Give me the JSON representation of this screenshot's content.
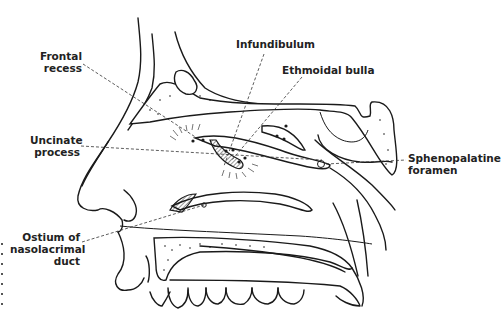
{
  "figure": {
    "type": "anatomical line drawing",
    "colors": {
      "ink": "#1a1a1a",
      "background": "#ffffff",
      "label": "#222222"
    }
  },
  "labels": {
    "frontal_recess": {
      "line1": "Frontal",
      "line2": "recess"
    },
    "infundibulum": {
      "line1": "Infundibulum"
    },
    "ethmoidal_bulla": {
      "line1": "Ethmoidal bulla"
    },
    "uncinate_process": {
      "line1": "Uncinate",
      "line2": "process"
    },
    "sphenopalatine_foramen": {
      "line1": "Sphenopalatine",
      "line2": "foramen"
    },
    "ostium_nasolacrimal": {
      "line1": "Ostium of",
      "line2": "nasolacrimal",
      "line3": "duct"
    }
  }
}
